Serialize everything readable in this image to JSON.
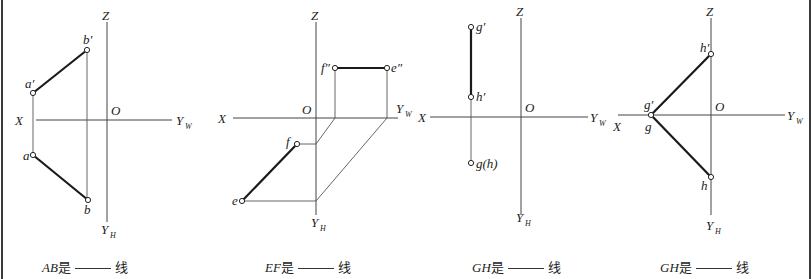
{
  "colors": {
    "line": "#1a1a1a",
    "axis": "#444444",
    "background": "#ffffff",
    "border": "#3a3a3a"
  },
  "diagrams": [
    {
      "axes": {
        "z": "Z",
        "o": "O",
        "x": "X",
        "yw": "Y",
        "yw_sub": "W",
        "yh": "Y",
        "yh_sub": "H"
      },
      "points": {
        "a_prime": "a′",
        "b_prime": "b′",
        "a": "a",
        "b": "b"
      },
      "caption": {
        "segment": "AB",
        "is": "是",
        "suffix": "线"
      }
    },
    {
      "axes": {
        "z": "Z",
        "o": "O",
        "x": "X",
        "yw": "Y",
        "yw_sub": "W",
        "yh": "Y",
        "yh_sub": "H"
      },
      "points": {
        "f_dprime": "f″",
        "e_dprime": "e″",
        "f": "f",
        "e": "e"
      },
      "caption": {
        "segment": "EF",
        "is": "是",
        "suffix": "线"
      }
    },
    {
      "axes": {
        "z": "Z",
        "o": "O",
        "x": "X",
        "yw": "Y",
        "yw_sub": "W",
        "yh": "Y",
        "yh_sub": "H"
      },
      "points": {
        "g_prime": "g′",
        "h_prime": "h′",
        "gh": "g(h)"
      },
      "caption": {
        "segment": "GH",
        "is": "是",
        "suffix": "线"
      }
    },
    {
      "axes": {
        "z": "Z",
        "o": "O",
        "x": "X",
        "yw": "Y",
        "yw_sub": "W",
        "yh": "Y",
        "yh_sub": "H"
      },
      "points": {
        "g_prime": "g′",
        "g": "g",
        "h_prime": "h′",
        "h": "h"
      },
      "caption": {
        "segment": "GH",
        "is": "是",
        "suffix": "线"
      }
    }
  ]
}
